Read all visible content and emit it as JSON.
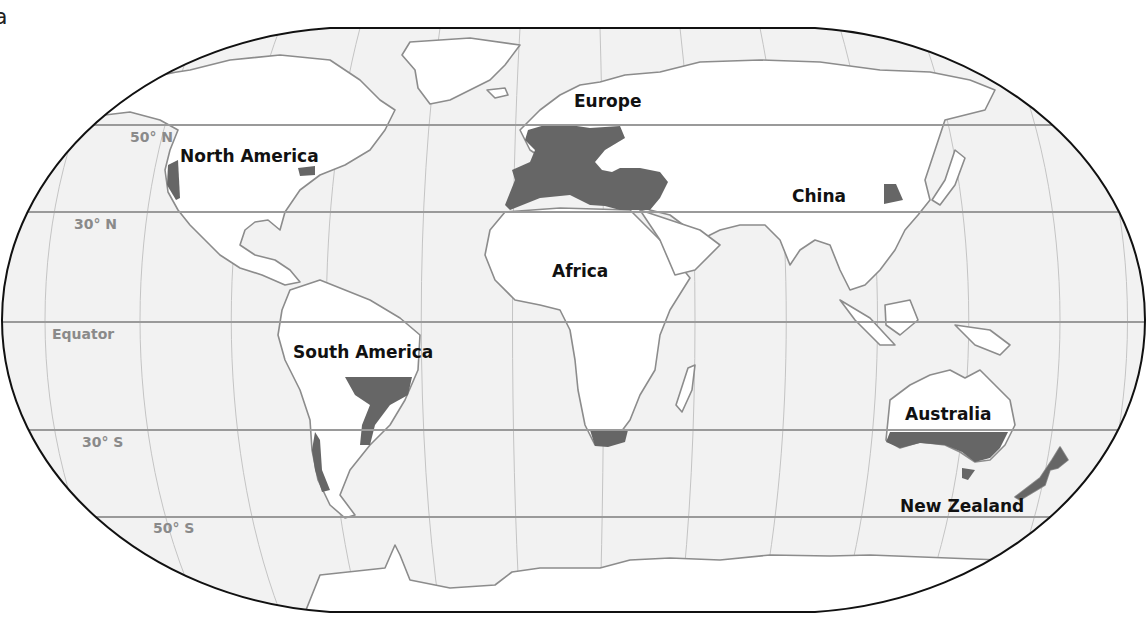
{
  "figure": {
    "panel_letter": "a",
    "projection": "Robinson (world)",
    "colors": {
      "ocean": "#f2f2f2",
      "land": "#ffffff",
      "coastline": "#8c8c8c",
      "highlighted_region": "#666666",
      "latitude_line": "#9a9a9a",
      "latitude_label": "#8a8a8a",
      "border": "#111111"
    }
  },
  "latitudes": [
    {
      "label": "50° N",
      "y": 125,
      "label_x": 130,
      "label_y": 142
    },
    {
      "label": "30° N",
      "y": 212,
      "label_x": 74,
      "label_y": 229
    },
    {
      "label": "Equator",
      "y": 322,
      "label_x": 52,
      "label_y": 339
    },
    {
      "label": "30° S",
      "y": 430,
      "label_x": 82,
      "label_y": 447
    },
    {
      "label": "50° S",
      "y": 517,
      "label_x": 153,
      "label_y": 533
    }
  ],
  "regions": [
    {
      "label": "North America",
      "x": 180,
      "y": 162
    },
    {
      "label": "Europe",
      "x": 574,
      "y": 107
    },
    {
      "label": "China",
      "x": 792,
      "y": 202
    },
    {
      "label": "Africa",
      "x": 552,
      "y": 277
    },
    {
      "label": "South America",
      "x": 293,
      "y": 358
    },
    {
      "label": "Australia",
      "x": 905,
      "y": 420
    },
    {
      "label": "New Zealand",
      "x": 900,
      "y": 512
    }
  ],
  "highlighted_areas": [
    "California (west coast of North America)",
    "Northeastern United States",
    "Western & Central Europe and Mediterranean basin",
    "North Africa coast",
    "Turkey / Middle East",
    "Northern China plain",
    "Southeastern South America",
    "Central Chile",
    "South Africa",
    "Southern Australia",
    "Tasmania",
    "New Zealand"
  ]
}
